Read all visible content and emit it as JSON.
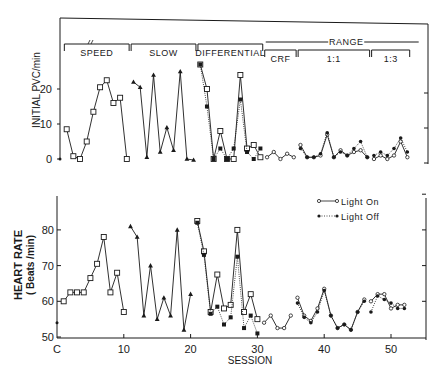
{
  "chart_data": [
    {
      "type": "line",
      "panel": "top",
      "title": "",
      "ylabel": "INITIAL PVC/min",
      "xlabel": "",
      "ylim": [
        0,
        27
      ],
      "yticks": [
        0,
        10,
        20
      ],
      "x_range": [
        0,
        55
      ],
      "grid": false,
      "phases": [
        {
          "label": "SPEED",
          "start": 0.5,
          "end": 10.5
        },
        {
          "label": "SLOW",
          "start": 10.5,
          "end": 20.5
        },
        {
          "label": "DIFFERENTIAL",
          "start": 20.5,
          "end": 30.5
        },
        {
          "label": "CRF",
          "start": 30.5,
          "end": 35.5
        },
        {
          "label": "1:1",
          "start": 35.5,
          "end": 46.5
        },
        {
          "label": "1:3",
          "start": 46.5,
          "end": 52.5
        }
      ],
      "group_label": {
        "label": "RANGE",
        "start": 30.5,
        "end": 52.5
      },
      "series": [
        {
          "name": "Control",
          "marker": "dot",
          "segments": [
            {
              "x": [
                0
              ],
              "y": [
                0
              ]
            }
          ]
        },
        {
          "name": "Speed",
          "marker": "open-square",
          "segments": [
            {
              "x": [
                1,
                2,
                3,
                4,
                5,
                6,
                7,
                8,
                9,
                10
              ],
              "y": [
                8.5,
                0.8,
                0,
                5,
                13.5,
                20.5,
                22.5,
                16,
                17.5,
                0
              ]
            }
          ]
        },
        {
          "name": "Slow",
          "marker": "triangle",
          "segments": [
            {
              "x": [
                11,
                12,
                13,
                14,
                15,
                16,
                17,
                18,
                19,
                20
              ],
              "y": [
                22,
                20.5,
                0.5,
                24,
                2,
                9,
                2.5,
                25,
                0,
                -0.3
              ]
            }
          ]
        },
        {
          "name": "Light On",
          "marker": "open-circle",
          "style": "solid",
          "segments": [
            {
              "x": [
                21,
                22,
                23,
                24,
                25,
                26,
                27,
                28,
                29,
                30
              ],
              "y": [
                27,
                20,
                0,
                8,
                0,
                0,
                24,
                3,
                4,
                0.5
              ]
            },
            {
              "x": [
                31,
                32,
                33,
                34,
                35
              ],
              "y": [
                0.5,
                2,
                0,
                1.5,
                0.5
              ]
            },
            {
              "x": [
                36,
                37,
                38,
                39,
                40,
                41,
                42,
                43,
                44,
                45,
                46
              ],
              "y": [
                4,
                0.5,
                0.5,
                1,
                7,
                0.5,
                2.5,
                1,
                2,
                2.5,
                0.5
              ]
            },
            {
              "x": [
                47,
                48,
                49,
                50,
                51,
                52
              ],
              "y": [
                0,
                1,
                0,
                1,
                5,
                0.5
              ]
            }
          ]
        },
        {
          "name": "Light Off",
          "marker": "filled-circle",
          "style": "dotted",
          "segments": [
            {
              "x": [
                21,
                22,
                23,
                24,
                25,
                26,
                27,
                28,
                29,
                30
              ],
              "y": [
                27,
                15,
                0,
                3,
                0,
                3,
                17,
                2,
                0,
                3
              ]
            },
            {
              "x": [
                36,
                37,
                38,
                39,
                40,
                41,
                42,
                43,
                44,
                45,
                46
              ],
              "y": [
                3,
                0.5,
                0.5,
                1.5,
                7.5,
                0.5,
                2,
                1,
                3,
                5,
                0.5
              ]
            },
            {
              "x": [
                47,
                48,
                49,
                50,
                51,
                52
              ],
              "y": [
                1,
                2,
                1,
                3,
                6,
                2
              ]
            }
          ]
        }
      ]
    },
    {
      "type": "line",
      "panel": "bottom",
      "title": "",
      "ylabel": "HEART RATE (Beats/min)",
      "xlabel": "SESSION",
      "ylim": [
        50,
        90
      ],
      "yticks": [
        50,
        60,
        70,
        80
      ],
      "xticks": [
        "C",
        "10",
        "20",
        "30",
        "40",
        "50"
      ],
      "x_range": [
        0,
        55
      ],
      "grid": false,
      "legend": {
        "position": "upper-right",
        "entries": [
          "Light On",
          "Light Off"
        ]
      },
      "series": [
        {
          "name": "Control",
          "marker": "dot",
          "segments": [
            {
              "x": [
                0
              ],
              "y": [
                54
              ]
            }
          ]
        },
        {
          "name": "Speed",
          "marker": "open-square",
          "segments": [
            {
              "x": [
                1,
                2,
                3,
                4,
                5,
                6,
                7,
                8,
                9,
                10
              ],
              "y": [
                60,
                62.5,
                62.5,
                62.5,
                66.5,
                70.5,
                78,
                62.5,
                68,
                57
              ]
            }
          ]
        },
        {
          "name": "Slow",
          "marker": "triangle",
          "segments": [
            {
              "x": [
                11,
                12,
                13,
                14,
                15,
                16,
                17,
                18,
                19,
                20
              ],
              "y": [
                81,
                78,
                56,
                70,
                55,
                61,
                56,
                80,
                52,
                62
              ]
            }
          ]
        },
        {
          "name": "Light On",
          "marker": "open-circle",
          "style": "solid",
          "segments": [
            {
              "x": [
                21,
                22,
                23,
                24,
                25,
                26,
                27,
                28,
                29,
                30
              ],
              "y": [
                82.5,
                74,
                57,
                67.5,
                58,
                59,
                80,
                57,
                62,
                55
              ]
            },
            {
              "x": [
                31,
                32,
                33,
                34,
                35
              ],
              "y": [
                54,
                56,
                52.5,
                52.5,
                56
              ]
            },
            {
              "x": [
                36,
                37,
                38,
                39,
                40,
                41,
                42,
                43,
                44,
                45,
                46
              ],
              "y": [
                61,
                56,
                54.5,
                58,
                63.5,
                56,
                52.5,
                53.5,
                52,
                57,
                60.5
              ]
            },
            {
              "x": [
                47,
                48,
                49,
                50,
                51,
                52
              ],
              "y": [
                60,
                62,
                62,
                58,
                59,
                59
              ]
            }
          ]
        },
        {
          "name": "Light Off",
          "marker": "filled-circle",
          "style": "dotted",
          "segments": [
            {
              "x": [
                21,
                22,
                23,
                24,
                25,
                26,
                27,
                28,
                29,
                30
              ],
              "y": [
                82,
                73,
                56.5,
                58.5,
                53.5,
                55.5,
                72.5,
                52.5,
                56,
                51
              ]
            },
            {
              "x": [
                36,
                37,
                38,
                39,
                40,
                41,
                42,
                43,
                44,
                45,
                46
              ],
              "y": [
                59.5,
                55.5,
                54,
                57,
                63,
                56,
                52.5,
                53.5,
                52,
                57,
                60
              ]
            },
            {
              "x": [
                47,
                48,
                49,
                50,
                51,
                52
              ],
              "y": [
                57,
                61.5,
                60.5,
                59.5,
                58,
                58
              ]
            }
          ]
        }
      ]
    }
  ],
  "labels": {
    "top_ylabel": "INITIAL PVC/min",
    "bottom_ylabel_line1": "HEART RATE",
    "bottom_ylabel_line2": "( Beats /min)",
    "xlabel": "SESSION",
    "legend_on": "Light On",
    "legend_off": "Light Off",
    "range": "RANGE",
    "phases": [
      "SPEED",
      "SLOW",
      "DIFFERENTIAL",
      "CRF",
      "1:1",
      "1:3"
    ],
    "top_yticks": [
      "0",
      "10",
      "20"
    ],
    "bottom_yticks": [
      "50",
      "60",
      "70",
      "80"
    ],
    "xticks": [
      "C",
      "10",
      "20",
      "30",
      "40",
      "50"
    ]
  },
  "colors": {
    "ink": "#1a1a1a",
    "background": "#ffffff"
  }
}
